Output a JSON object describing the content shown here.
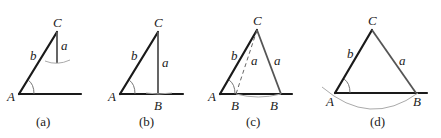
{
  "figure": {
    "panels": [
      {
        "id": "a",
        "caption": "(a)",
        "vertex_labels": {
          "A": "A",
          "C": "C"
        },
        "side_labels": {
          "a": "a",
          "b": "b"
        },
        "description": "Side a too short to reach baseline; no triangle"
      },
      {
        "id": "b",
        "caption": "(b)",
        "vertex_labels": {
          "A": "A",
          "B": "B",
          "C": "C"
        },
        "side_labels": {
          "a": "a",
          "b": "b"
        },
        "description": "Side a exactly reaches baseline; one right triangle"
      },
      {
        "id": "c",
        "caption": "(c)",
        "vertex_labels": {
          "A": "A",
          "B1": "B",
          "B2": "B",
          "C": "C"
        },
        "side_labels": {
          "a1": "a",
          "a2": "a",
          "b": "b"
        },
        "description": "Side a intersects baseline twice; two triangles"
      },
      {
        "id": "d",
        "caption": "(d)",
        "vertex_labels": {
          "A": "A",
          "B": "B",
          "C": "C"
        },
        "side_labels": {
          "a": "a",
          "b": "b"
        },
        "description": "Side a longer than b; one triangle"
      }
    ],
    "colors": {
      "line": "#1a1a1a",
      "side_a": "#555555",
      "arc": "#aaaaaa"
    }
  }
}
